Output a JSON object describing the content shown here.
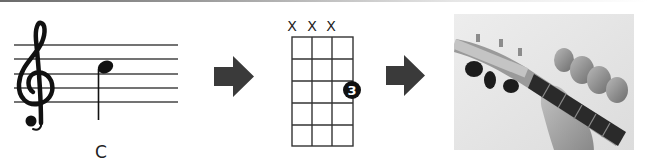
{
  "figure": {
    "steps": [
      {
        "id": "notation",
        "kind": "staff-notation",
        "note_label": "C"
      },
      {
        "id": "chord-diagram",
        "kind": "ukulele-chord-chart",
        "string_marks": [
          "X",
          "X",
          "X",
          ""
        ],
        "strings": 4,
        "frets": 5,
        "finger": {
          "number": "3",
          "string": 4,
          "fret": 3
        }
      },
      {
        "id": "photo",
        "kind": "photograph",
        "description": "hand fretting C chord on ukulele neck"
      }
    ],
    "arrows": [
      "arrow-1",
      "arrow-2"
    ],
    "colors": {
      "ink": "#111111",
      "arrow": "#3a3a3a",
      "grid": "#333333",
      "photo_bg": "#e8e8e8"
    }
  }
}
